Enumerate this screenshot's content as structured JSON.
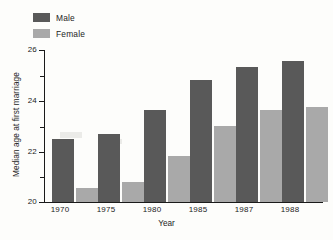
{
  "chart_data": {
    "type": "bar",
    "title": "",
    "subtitle": "",
    "xlabel": "Year",
    "ylabel": "Median age at first marriage",
    "categories": [
      "1970",
      "1975",
      "1980",
      "1985",
      "1987",
      "1988"
    ],
    "series": [
      {
        "name": "Male",
        "color": "#595959",
        "values": [
          22.5,
          22.7,
          23.65,
          24.8,
          25.35,
          25.55
        ]
      },
      {
        "name": "Female",
        "color": "#a9a9a9",
        "values": [
          20.55,
          20.8,
          21.8,
          23.0,
          23.65,
          23.75
        ]
      }
    ],
    "ylim": [
      20,
      26
    ],
    "yticks": [
      20,
      22,
      24,
      26
    ],
    "ytick_labels": [
      "20",
      "22",
      "24",
      "26"
    ],
    "yminor_ticks": [
      21,
      23,
      25
    ],
    "xlim_categories": 6,
    "grid": false,
    "legend_position": "top-left-inside",
    "bar_grouping": "grouped",
    "annotations": []
  },
  "legend": {
    "items": [
      {
        "label": "Male"
      },
      {
        "label": "Female"
      }
    ]
  },
  "axes": {
    "y_title": "Median age at first marriage",
    "x_title": "Year",
    "y_tick_labels": [
      "26",
      "24",
      "22",
      "20"
    ],
    "x_tick_labels": [
      "1970",
      "1975",
      "1980",
      "1985",
      "1987",
      "1988"
    ]
  }
}
